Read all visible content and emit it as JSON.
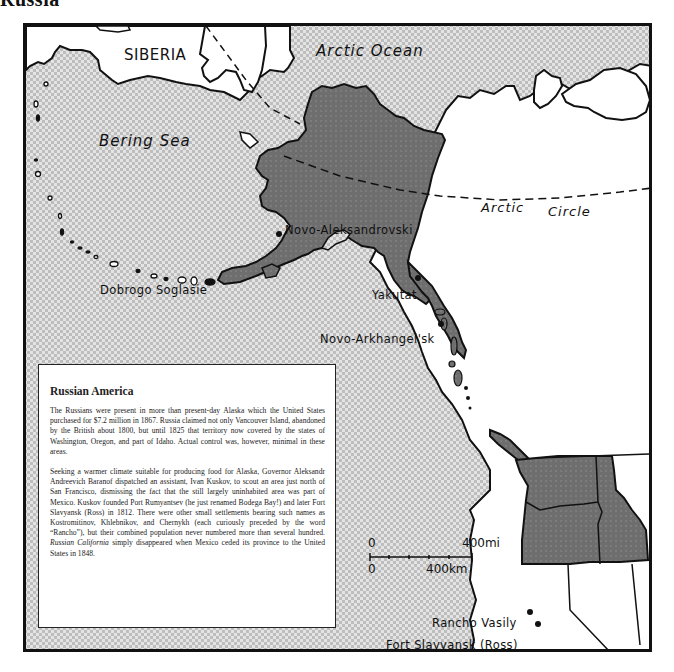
{
  "page": {
    "title_fragment": "Russia"
  },
  "map": {
    "labels": {
      "region_siberia": "SIBERIA",
      "water_arctic_ocean": "Arctic Ocean",
      "water_bering_sea": "Bering Sea",
      "arctic_circle_word1": "Arctic",
      "arctic_circle_word2": "Circle"
    },
    "settlements": [
      {
        "name": "Novo-Aleksandrovski"
      },
      {
        "name": "Dobrogo Soglasie"
      },
      {
        "name": "Yakutat"
      },
      {
        "name": "Novo-Arkhangel'sk"
      },
      {
        "name": "Rancho Vasily"
      },
      {
        "name": "Fort Slavyansk (Ross)"
      }
    ],
    "scale_bar": {
      "mi_zero": "0",
      "mi_max": "400mi",
      "km_zero": "0",
      "km_max": "400km"
    },
    "colors": {
      "russian_territory": "#6b6b6b",
      "ocean_stipple": "#c9c9c9",
      "land_other": "#ffffff",
      "outline": "#111111"
    }
  },
  "info_box": {
    "title": "Russian America",
    "paragraph1": "The Russians were present in more than present-day Alaska which the United States purchased for $7.2 million in 1867. Russia claimed not only Vancouver Island, abandoned by the British about 1800, but until 1825 that territory now covered by the states of Washington, Oregon, and part of Idaho. Actual control was, however, minimal in these areas.",
    "paragraph2_main": "Seeking a warmer climate suitable for producing food for Alaska, Governor Aleksandr Andreevich Baranof dispatched an assistant, Ivan Kuskov, to scout an area just north of San Francisco, dismissing the fact that the still largely uninhabited area was part of Mexico. Kuskov founded Port Rumyantsev (he just renamed Bodega Bay!) and later Fort Slavyansk (Ross) in 1812. There were other small settlements bearing such names as Kostromitinov, Khlebnikov, and Chernykh (each curiously preceded by the word “Rancho”), but their combined population never numbered more than several hundred. ",
    "paragraph2_italic": "Russian California",
    "paragraph2_end": " simply disappeared when Mexico ceded its province to the United States in 1848."
  }
}
